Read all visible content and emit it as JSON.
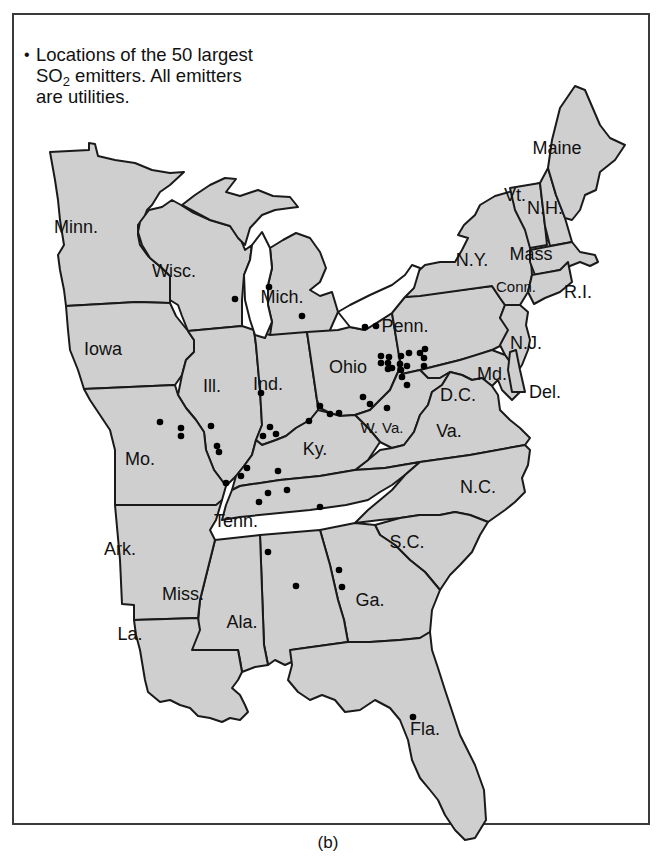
{
  "legend": {
    "bullet": "•",
    "line1": "Locations of the 50 largest",
    "line2_pre": "SO",
    "line2_sub": "2",
    "line2_post": " emitters. All emitters",
    "line3": "are utilities."
  },
  "caption": "(b)",
  "colors": {
    "state_fill": "#cfcfcf",
    "border": "#1a1a1a",
    "dot": "#000000",
    "background": "#ffffff"
  },
  "states": [
    {
      "name": "Minn.",
      "x": 76,
      "y": 233
    },
    {
      "name": "Wisc.",
      "x": 174,
      "y": 277
    },
    {
      "name": "Mich.",
      "x": 282,
      "y": 303
    },
    {
      "name": "Iowa",
      "x": 103,
      "y": 355
    },
    {
      "name": "Ill.",
      "x": 212,
      "y": 392
    },
    {
      "name": "Ind.",
      "x": 268,
      "y": 390
    },
    {
      "name": "Ohio",
      "x": 348,
      "y": 373
    },
    {
      "name": "Penn.",
      "x": 405,
      "y": 332
    },
    {
      "name": "N.Y.",
      "x": 472,
      "y": 266
    },
    {
      "name": "Vt.",
      "x": 515,
      "y": 201
    },
    {
      "name": "N.H.",
      "x": 545,
      "y": 214
    },
    {
      "name": "Maine",
      "x": 557,
      "y": 154
    },
    {
      "name": "Mass",
      "x": 531,
      "y": 260
    },
    {
      "name": "Conn.",
      "x": 516,
      "y": 292
    },
    {
      "name": "R.I.",
      "x": 578,
      "y": 298
    },
    {
      "name": "N.J.",
      "x": 526,
      "y": 349
    },
    {
      "name": "Md.",
      "x": 492,
      "y": 380
    },
    {
      "name": "Del.",
      "x": 545,
      "y": 398
    },
    {
      "name": "D.C.",
      "x": 458,
      "y": 401
    },
    {
      "name": "W. Va.",
      "x": 382,
      "y": 433
    },
    {
      "name": "Va.",
      "x": 449,
      "y": 437
    },
    {
      "name": "Ky.",
      "x": 315,
      "y": 455
    },
    {
      "name": "Mo.",
      "x": 140,
      "y": 465
    },
    {
      "name": "N.C.",
      "x": 478,
      "y": 493
    },
    {
      "name": "Tenn.",
      "x": 236,
      "y": 527
    },
    {
      "name": "S.C.",
      "x": 407,
      "y": 548
    },
    {
      "name": "Ark.",
      "x": 120,
      "y": 555
    },
    {
      "name": "Miss.",
      "x": 183,
      "y": 600
    },
    {
      "name": "Ga.",
      "x": 370,
      "y": 606
    },
    {
      "name": "Ala.",
      "x": 242,
      "y": 628
    },
    {
      "name": "La.",
      "x": 130,
      "y": 640
    },
    {
      "name": "Fla.",
      "x": 425,
      "y": 735
    }
  ],
  "emitters": [
    [
      235,
      299
    ],
    [
      269,
      287
    ],
    [
      302,
      316
    ],
    [
      365,
      327
    ],
    [
      376,
      326
    ],
    [
      381,
      356
    ],
    [
      388,
      363
    ],
    [
      381,
      363
    ],
    [
      389,
      357
    ],
    [
      388,
      369
    ],
    [
      401,
      356
    ],
    [
      400,
      364
    ],
    [
      401,
      370
    ],
    [
      407,
      366
    ],
    [
      409,
      353
    ],
    [
      420,
      353
    ],
    [
      424,
      358
    ],
    [
      425,
      349
    ],
    [
      424,
      366
    ],
    [
      402,
      377
    ],
    [
      407,
      385
    ],
    [
      392,
      368
    ],
    [
      363,
      397
    ],
    [
      370,
      404
    ],
    [
      387,
      408
    ],
    [
      320,
      406
    ],
    [
      330,
      414
    ],
    [
      339,
      413
    ],
    [
      261,
      393
    ],
    [
      309,
      421
    ],
    [
      160,
      422
    ],
    [
      181,
      428
    ],
    [
      181,
      436
    ],
    [
      211,
      426
    ],
    [
      217,
      446
    ],
    [
      219,
      452
    ],
    [
      270,
      427
    ],
    [
      276,
      434
    ],
    [
      263,
      436
    ],
    [
      226,
      483
    ],
    [
      247,
      468
    ],
    [
      241,
      476
    ],
    [
      278,
      471
    ],
    [
      259,
      502
    ],
    [
      268,
      493
    ],
    [
      287,
      490
    ],
    [
      320,
      507
    ],
    [
      268,
      552
    ],
    [
      296,
      586
    ],
    [
      339,
      570
    ],
    [
      342,
      587
    ],
    [
      413,
      717
    ]
  ],
  "emitter_count_label": "50 largest"
}
